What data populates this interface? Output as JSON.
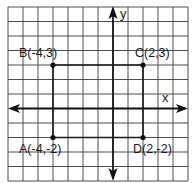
{
  "diagram": {
    "type": "coordinate-grid",
    "grid": {
      "cols": 12,
      "rows": 12,
      "x_range": [
        -7,
        5
      ],
      "y_range": [
        -5,
        7
      ]
    },
    "axes": {
      "x_label": "x",
      "y_label": "y"
    },
    "points": [
      {
        "name": "A",
        "x": -4,
        "y": -2,
        "label": "A(-4,-2)"
      },
      {
        "name": "B",
        "x": -4,
        "y": 3,
        "label": "B(-4,3)"
      },
      {
        "name": "C",
        "x": 2,
        "y": 3,
        "label": "C(2,3)"
      },
      {
        "name": "D",
        "x": 2,
        "y": -2,
        "label": "D(2,-2)"
      }
    ],
    "shape": "rectangle ABCD",
    "colors": {
      "ink": "#111111",
      "grid": "#3a3a3a",
      "background": "#ffffff"
    }
  }
}
